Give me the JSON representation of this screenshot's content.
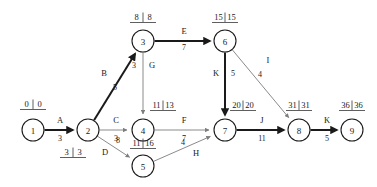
{
  "diagram": {
    "type": "activity-on-arrow-network",
    "title": "",
    "colors": {
      "critical_path": "#1a1a1a",
      "normal_edge": "#7d7d7d",
      "node_stroke": "#1a1a1a",
      "background": "#ffffff"
    },
    "nodes": [
      {
        "id": "1",
        "label": "1",
        "cx": 33,
        "cy": 130,
        "r": 11,
        "times": {
          "early": "0",
          "late": "0",
          "text": "0 | 0",
          "x": 33,
          "y": 107,
          "position": "above"
        }
      },
      {
        "id": "2",
        "label": "2",
        "cx": 88,
        "cy": 130,
        "r": 11,
        "times": {
          "early": "3",
          "late": "3",
          "text": "3 | 3",
          "x": 73,
          "y": 155,
          "position": "below"
        }
      },
      {
        "id": "3",
        "label": "3",
        "cx": 143,
        "cy": 41,
        "r": 11,
        "times": {
          "early": "8",
          "late": "8",
          "text": "8 | 8",
          "x": 143,
          "y": 20,
          "position": "above"
        }
      },
      {
        "id": "4",
        "label": "4",
        "cx": 143,
        "cy": 130,
        "r": 11,
        "times": {
          "early": "11",
          "late": "13",
          "text": "11|13",
          "x": 163,
          "y": 108,
          "position": "above-right"
        }
      },
      {
        "id": "5",
        "label": "5",
        "cx": 143,
        "cy": 166,
        "r": 11,
        "times": {
          "early": "11",
          "late": "16",
          "text": "11|16",
          "x": 143,
          "y": 146,
          "position": "above"
        }
      },
      {
        "id": "6",
        "label": "6",
        "cx": 225,
        "cy": 41,
        "r": 11,
        "times": {
          "early": "15",
          "late": "15",
          "text": "15|15",
          "x": 225,
          "y": 20,
          "position": "above"
        }
      },
      {
        "id": "7",
        "label": "7",
        "cx": 225,
        "cy": 130,
        "r": 11,
        "times": {
          "early": "20",
          "late": "20",
          "text": "20|20",
          "x": 243,
          "y": 108,
          "position": "above-right"
        }
      },
      {
        "id": "8",
        "label": "8",
        "cx": 299,
        "cy": 130,
        "r": 11,
        "times": {
          "early": "31",
          "late": "31",
          "text": "31|31",
          "x": 299,
          "y": 108,
          "position": "above"
        }
      },
      {
        "id": "9",
        "label": "9",
        "cx": 352,
        "cy": 130,
        "r": 11,
        "times": {
          "early": "36",
          "late": "36",
          "text": "36|36",
          "x": 352,
          "y": 108,
          "position": "above"
        }
      }
    ],
    "edges": [
      {
        "activity": "A",
        "duration": "3",
        "from": "1",
        "to": "2",
        "critical": true,
        "name_x": 60,
        "name_y": 123,
        "dur_x": 60,
        "dur_y": 141
      },
      {
        "activity": "B",
        "duration": "5",
        "from": "2",
        "to": "3",
        "critical": true,
        "name_x": 104,
        "name_y": 76,
        "dur_x": 115,
        "dur_y": 90
      },
      {
        "activity": "C",
        "duration": "3",
        "from": "2",
        "to": "4",
        "critical": false,
        "name_x": 116,
        "name_y": 123,
        "dur_x": 116,
        "dur_y": 141
      },
      {
        "activity": "D",
        "duration": "8",
        "from": "2",
        "to": "5",
        "critical": false,
        "name_x": 105,
        "name_y": 155,
        "dur_x": 118,
        "dur_y": 143
      },
      {
        "activity": "E",
        "duration": "7",
        "from": "3",
        "to": "6",
        "critical": true,
        "name_x": 184,
        "name_y": 34,
        "dur_x": 184,
        "dur_y": 50
      },
      {
        "activity": "G",
        "duration": "3",
        "from": "3",
        "to": "4",
        "critical": false,
        "name_x": 152,
        "name_y": 68,
        "dur_x": 134,
        "dur_y": 68
      },
      {
        "activity": "F",
        "duration": "7",
        "from": "4",
        "to": "7",
        "critical": false,
        "name_x": 184,
        "name_y": 123,
        "dur_x": 184,
        "dur_y": 141
      },
      {
        "activity": "H",
        "duration": "4",
        "from": "5",
        "to": "7",
        "critical": false,
        "name_x": 196,
        "name_y": 156,
        "dur_x": 183,
        "dur_y": 145
      },
      {
        "activity": "K",
        "duration": "5",
        "from": "6",
        "to": "7",
        "critical": true,
        "name_x": 216,
        "name_y": 76,
        "dur_x": 233,
        "dur_y": 76
      },
      {
        "activity": "I",
        "duration": "4",
        "from": "6",
        "to": "8",
        "critical": false,
        "name_x": 268,
        "name_y": 63,
        "dur_x": 260,
        "dur_y": 77
      },
      {
        "activity": "J",
        "duration": "11",
        "from": "7",
        "to": "8",
        "critical": true,
        "name_x": 262,
        "name_y": 123,
        "dur_x": 262,
        "dur_y": 141
      },
      {
        "activity": "K",
        "duration": "5",
        "from": "8",
        "to": "9",
        "critical": true,
        "name_x": 327,
        "name_y": 123,
        "dur_x": 327,
        "dur_y": 141
      }
    ],
    "critical_path": [
      "1",
      "2",
      "3",
      "6",
      "7",
      "8",
      "9"
    ]
  }
}
